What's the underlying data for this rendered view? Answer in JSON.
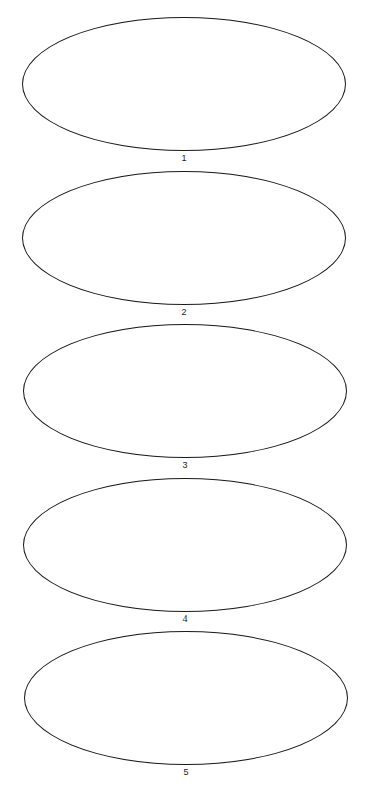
{
  "diagram": {
    "stroke_color": "#1a1a1a",
    "background": "#ffffff",
    "shapes": [
      {
        "label": "1",
        "cx": 184,
        "cy": 84,
        "rx": 162,
        "ry": 67,
        "label_y": 153
      },
      {
        "label": "2",
        "cx": 184,
        "cy": 238,
        "rx": 162,
        "ry": 67,
        "label_y": 307
      },
      {
        "label": "3",
        "cx": 185,
        "cy": 391,
        "rx": 162,
        "ry": 67,
        "label_y": 460
      },
      {
        "label": "4",
        "cx": 185,
        "cy": 545,
        "rx": 162,
        "ry": 67,
        "label_y": 614
      },
      {
        "label": "5",
        "cx": 186,
        "cy": 698,
        "rx": 162,
        "ry": 67,
        "label_y": 767
      }
    ]
  }
}
